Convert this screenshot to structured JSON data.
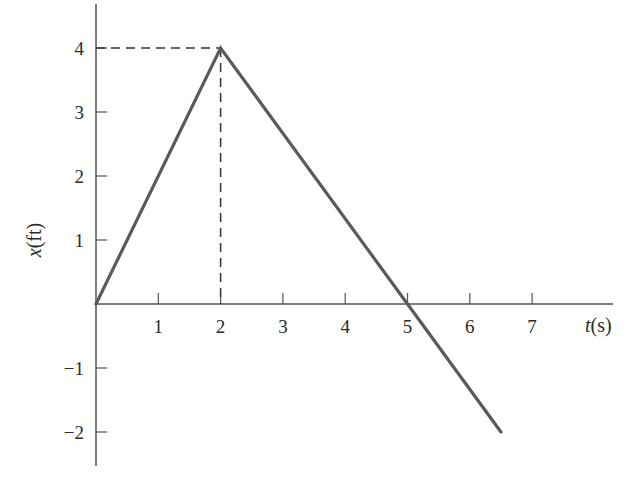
{
  "chart_data": {
    "type": "line",
    "title": "",
    "xlabel": "t(s)",
    "ylabel": "x(ft)",
    "xlabel_parts": {
      "var": "t",
      "unit": "(s)"
    },
    "ylabel_parts": {
      "var": "x",
      "unit": "(ft)"
    },
    "x_ticks": [
      1,
      2,
      3,
      4,
      5,
      6,
      7
    ],
    "y_ticks": [
      4,
      3,
      2,
      1,
      -1,
      -2
    ],
    "x_tick_labels": [
      "1",
      "2",
      "3",
      "4",
      "5",
      "6",
      "7"
    ],
    "y_tick_labels": [
      "4",
      "3",
      "2",
      "1",
      "−1",
      "−2"
    ],
    "xlim": [
      0,
      8.2
    ],
    "ylim": [
      -2.5,
      4.7
    ],
    "grid": false,
    "legend": null,
    "series": [
      {
        "name": "x(t)",
        "x": [
          0,
          2,
          5,
          6.5
        ],
        "y": [
          0,
          4,
          0,
          -2
        ]
      }
    ],
    "annotations": [
      {
        "type": "dashed-guide",
        "from": [
          0,
          4
        ],
        "to": [
          2,
          4
        ],
        "description": "horizontal dashed line at x=4 ft"
      },
      {
        "type": "dashed-guide",
        "from": [
          2,
          4
        ],
        "to": [
          2,
          0
        ],
        "description": "vertical dashed line at t=2 s"
      }
    ],
    "colors": {
      "line": "#5a5a5a",
      "axes": "#555555",
      "text": "#2a2a2a",
      "background": "#ffffff"
    }
  }
}
